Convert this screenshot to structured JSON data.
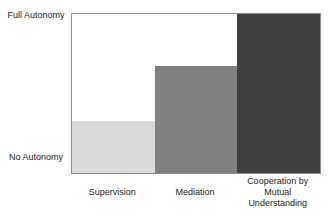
{
  "chart_data": {
    "type": "bar",
    "title": "",
    "xlabel": "",
    "ylabel": "",
    "ylim": [
      0,
      100
    ],
    "y_tick_labels": [
      {
        "position": 100,
        "label": "Full Autonomy"
      },
      {
        "position": 0,
        "label": "No Autonomy"
      }
    ],
    "categories": [
      "Supervision",
      "Mediation",
      "Cooperation by Mutual Understanding"
    ],
    "values": [
      33,
      67,
      100
    ],
    "colors": [
      "#d9d9d9",
      "#808080",
      "#404040"
    ],
    "grid": false,
    "legend": null,
    "bar_gap": 0
  },
  "labels": {
    "y_top": "Full Autonomy",
    "y_bottom": "No Autonomy",
    "x": [
      "Supervision",
      "Mediation",
      "Cooperation by Mutual Understanding"
    ]
  }
}
